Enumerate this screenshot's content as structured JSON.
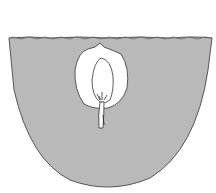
{
  "diagram": {
    "colors": {
      "background": "#ffffff",
      "soil_fill": "#b9b9b9",
      "soil_outline": "#555555",
      "seed_fill": "#ffffff",
      "line": "#333333"
    },
    "parts": [
      "soil",
      "soil-surface",
      "seed-coat",
      "endosperm",
      "embryo",
      "radicle"
    ]
  }
}
